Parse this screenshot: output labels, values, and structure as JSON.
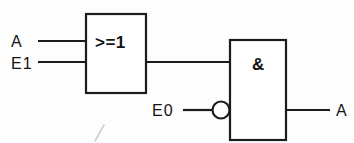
{
  "diagram": {
    "kind": "logic-circuit-diagram",
    "notation": "IEC 60617 rectangular logic symbols",
    "background_color": "#fdfdfd",
    "ink_color": "#1c1c1c",
    "gates": [
      {
        "id": "or-gate",
        "symbol": ">=1",
        "function": "OR",
        "inputs": [
          "A",
          "E1"
        ],
        "output_to": "and-gate"
      },
      {
        "id": "and-gate",
        "symbol": "&",
        "function": "AND",
        "inputs": [
          "or-gate-output",
          "E0"
        ],
        "inverted_inputs": [
          "E0"
        ],
        "output": "A"
      }
    ],
    "labels": {
      "input_a": "A",
      "input_e1": "E1",
      "input_e0": "E0",
      "output_a": "A"
    },
    "annotations": {
      "stray_pencil_mark": "/"
    }
  }
}
